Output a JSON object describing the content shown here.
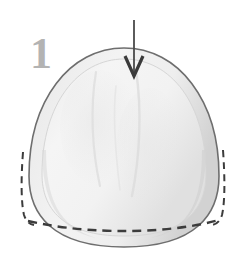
{
  "figure": {
    "kind": "instructional-step-diagram",
    "step_label": "1",
    "background_color": "#ffffff",
    "canvas": {
      "width": 246,
      "height": 271
    },
    "step_number": {
      "value": "1",
      "color": "#b3b3b3",
      "x": 30,
      "y": 68,
      "font_size": 44
    },
    "arrow": {
      "name": "down-arrow",
      "direction": "down",
      "color": "#4a4a4a",
      "shaft": {
        "x": 134,
        "y_start": 20,
        "y_end": 68
      },
      "head": {
        "tip_x": 134,
        "tip_y": 76,
        "left_x": 125,
        "right_x": 143,
        "shoulder_y": 56
      },
      "stroke_width": 2
    },
    "dome": {
      "name": "dome-outline",
      "outline_color": "#6e6e6e",
      "outline_width": 1.6,
      "fill_color": "#e9e9e9",
      "bounds": {
        "left": 29,
        "right": 219,
        "top": 48,
        "bottom": 247
      },
      "inner_highlight_color": "#f4f4f4",
      "inner_shadow_color": "#d7d7d7",
      "rim_band_color": "#dcdcdc"
    },
    "dashed_lines": [
      {
        "name": "dashed-left-edge",
        "orientation": "vertical",
        "color": "#3c3c3c",
        "dash": "7 5",
        "width": 2,
        "points": "23,152 21,196 23,214 32,224"
      },
      {
        "name": "dashed-right-edge",
        "orientation": "vertical",
        "color": "#3c3c3c",
        "dash": "7 5",
        "width": 2,
        "points": "222,150 224,196 222,215 212,224"
      },
      {
        "name": "dashed-bottom-fold",
        "orientation": "horizontal",
        "color": "#3c3c3c",
        "dash": "8 6",
        "width": 2.4,
        "points": "28,222 80,228 124,230 170,228 218,221"
      }
    ]
  }
}
